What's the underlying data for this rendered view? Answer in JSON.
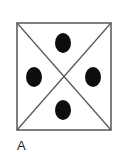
{
  "figure": {
    "label": "A",
    "box": {
      "x": 17,
      "y": 23,
      "width": 94,
      "height": 107,
      "stroke": "#555555",
      "stroke_width": 1.5
    },
    "diagonals": {
      "stroke": "#555555",
      "stroke_width": 1.2
    },
    "dots": [
      {
        "name": "top",
        "cx": 63,
        "cy": 43,
        "rx": 8,
        "ry": 10,
        "fill": "#0d0d0d"
      },
      {
        "name": "left",
        "cx": 34,
        "cy": 77,
        "rx": 8,
        "ry": 10,
        "fill": "#0d0d0d"
      },
      {
        "name": "right",
        "cx": 93,
        "cy": 77,
        "rx": 8,
        "ry": 10,
        "fill": "#0d0d0d"
      },
      {
        "name": "bottom",
        "cx": 63,
        "cy": 110,
        "rx": 8,
        "ry": 10,
        "fill": "#0d0d0d"
      }
    ]
  }
}
